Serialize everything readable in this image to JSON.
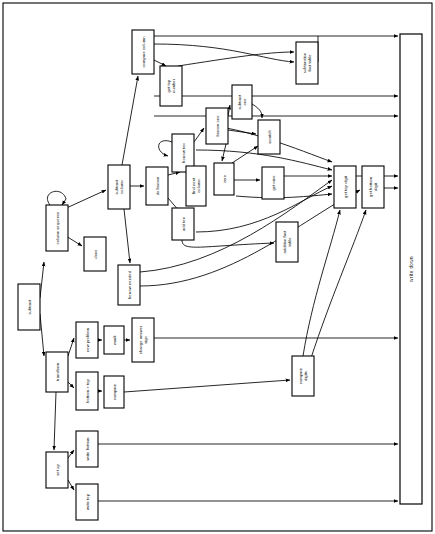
{
  "diagram": {
    "type": "flowchart",
    "orientation": "rotated-90-ccw-labels",
    "canvas": {
      "width": 435,
      "height": 534
    },
    "colors": {
      "stroke": "#000000",
      "fill": "#ffffff",
      "background": "#ffffff"
    },
    "border": {
      "x": 3,
      "y": 3,
      "width": 429,
      "height": 528
    },
    "nodes": [
      {
        "id": "subtract",
        "label": "subtract",
        "x": 18,
        "y": 284,
        "w": 22,
        "h": 46
      },
      {
        "id": "column-sequence",
        "label": "column sequence",
        "x": 46,
        "y": 205,
        "w": 22,
        "h": 46
      },
      {
        "id": "set-up",
        "label": "set up",
        "x": 46,
        "y": 452,
        "w": 22,
        "h": 36
      },
      {
        "id": "transform",
        "label": "transform",
        "x": 46,
        "y": 352,
        "w": 22,
        "h": 40
      },
      {
        "id": "done",
        "label": "done",
        "x": 84,
        "y": 237,
        "w": 22,
        "h": 34
      },
      {
        "id": "write-bottom",
        "label": "write bottom",
        "x": 76,
        "y": 431,
        "w": 22,
        "h": 36
      },
      {
        "id": "write-top",
        "label": "write top",
        "x": 76,
        "y": 484,
        "w": 22,
        "h": 36
      },
      {
        "id": "new-problem",
        "label": "new problem",
        "x": 76,
        "y": 322,
        "w": 22,
        "h": 36
      },
      {
        "id": "mark",
        "label": "mark",
        "x": 104,
        "y": 326,
        "w": 20,
        "h": 28
      },
      {
        "id": "change-answer-sign",
        "label": "change answer sign",
        "x": 132,
        "y": 318,
        "w": 22,
        "h": 44
      },
      {
        "id": "bottom-gt-top",
        "label": "bottom > top",
        "x": 76,
        "y": 372,
        "w": 22,
        "h": 38
      },
      {
        "id": "compare",
        "label": "compare",
        "x": 104,
        "y": 376,
        "w": 20,
        "h": 32
      },
      {
        "id": "subtract-column",
        "label": "subtract column",
        "x": 108,
        "y": 165,
        "w": 22,
        "h": 44
      },
      {
        "id": "borrow-needed",
        "label": "borrow needed",
        "x": 118,
        "y": 265,
        "w": 22,
        "h": 40
      },
      {
        "id": "do-borrow",
        "label": "do borrow",
        "x": 146,
        "y": 167,
        "w": 22,
        "h": 38
      },
      {
        "id": "compare-column",
        "label": "compare column",
        "x": 132,
        "y": 30,
        "w": 22,
        "h": 44
      },
      {
        "id": "get-top-number",
        "label": "get top number",
        "x": 160,
        "y": 66,
        "w": 22,
        "h": 40
      },
      {
        "id": "borrow-ten",
        "label": "borrow ten",
        "x": 172,
        "y": 134,
        "w": 22,
        "h": 38
      },
      {
        "id": "add-ten",
        "label": "add ten",
        "x": 172,
        "y": 208,
        "w": 22,
        "h": 32
      },
      {
        "id": "find-next-column",
        "label": "find next column",
        "x": 186,
        "y": 166,
        "w": 20,
        "h": 40
      },
      {
        "id": "borrow-one",
        "label": "borrow one",
        "x": 206,
        "y": 108,
        "w": 22,
        "h": 36
      },
      {
        "id": "subtract-one",
        "label": "subtract one",
        "x": 232,
        "y": 85,
        "w": 20,
        "h": 34
      },
      {
        "id": "zero",
        "label": "zero",
        "x": 214,
        "y": 163,
        "w": 20,
        "h": 32
      },
      {
        "id": "scratch",
        "label": "scratch",
        "x": 258,
        "y": 120,
        "w": 22,
        "h": 34
      },
      {
        "id": "get-nine",
        "label": "get nine",
        "x": 262,
        "y": 167,
        "w": 22,
        "h": 32
      },
      {
        "id": "addition-fact-table",
        "label": "addition fact table",
        "x": 276,
        "y": 222,
        "w": 22,
        "h": 40
      },
      {
        "id": "subtraction-fact-table",
        "label": "subtraction fact table",
        "x": 296,
        "y": 42,
        "w": 22,
        "h": 42
      },
      {
        "id": "get-top-digit",
        "label": "get top digit",
        "x": 334,
        "y": 166,
        "w": 22,
        "h": 42
      },
      {
        "id": "get-bottom-digit",
        "label": "get bottom digit",
        "x": 362,
        "y": 166,
        "w": 22,
        "h": 42
      },
      {
        "id": "compare-digits",
        "label": "compare digits",
        "x": 292,
        "y": 356,
        "w": 22,
        "h": 40
      },
      {
        "id": "write-down",
        "label": "write down",
        "x": 400,
        "y": 34,
        "w": 22,
        "h": 470,
        "tall": true
      }
    ],
    "edges": [
      {
        "from": "subtract",
        "to": "column-sequence"
      },
      {
        "from": "subtract",
        "to": "transform"
      },
      {
        "from": "column-sequence",
        "to": "column-sequence",
        "type": "self-loop"
      },
      {
        "from": "column-sequence",
        "to": "subtract-column"
      },
      {
        "from": "column-sequence",
        "to": "done"
      },
      {
        "from": "transform",
        "to": "new-problem"
      },
      {
        "from": "transform",
        "to": "bottom-gt-top"
      },
      {
        "from": "transform",
        "to": "set-up"
      },
      {
        "from": "new-problem",
        "to": "mark"
      },
      {
        "from": "mark",
        "to": "change-answer-sign"
      },
      {
        "from": "change-answer-sign",
        "to": "write-down"
      },
      {
        "from": "bottom-gt-top",
        "to": "compare"
      },
      {
        "from": "compare",
        "to": "compare-digits"
      },
      {
        "from": "compare-digits",
        "to": "get-top-digit"
      },
      {
        "from": "compare-digits",
        "to": "get-bottom-digit"
      },
      {
        "from": "set-up",
        "to": "write-bottom"
      },
      {
        "from": "set-up",
        "to": "write-top"
      },
      {
        "from": "write-bottom",
        "to": "write-down"
      },
      {
        "from": "write-top",
        "to": "write-down"
      },
      {
        "from": "subtract-column",
        "to": "do-borrow"
      },
      {
        "from": "subtract-column",
        "to": "compare-column"
      },
      {
        "from": "subtract-column",
        "to": "borrow-needed"
      },
      {
        "from": "do-borrow",
        "to": "borrow-ten"
      },
      {
        "from": "do-borrow",
        "to": "add-ten"
      },
      {
        "from": "borrow-ten",
        "to": "borrow-one"
      },
      {
        "from": "borrow-ten",
        "to": "find-next-column"
      },
      {
        "from": "borrow-ten",
        "to": "borrow-ten",
        "type": "self-loop"
      },
      {
        "from": "borrow-one",
        "to": "subtract-one"
      },
      {
        "from": "borrow-one",
        "to": "zero"
      },
      {
        "from": "borrow-one",
        "to": "scratch"
      },
      {
        "from": "zero",
        "to": "get-nine"
      },
      {
        "from": "zero",
        "to": "scratch"
      },
      {
        "from": "subtract-one",
        "to": "scratch"
      },
      {
        "from": "add-ten",
        "to": "addition-fact-table"
      },
      {
        "from": "compare-column",
        "to": "get-top-number"
      },
      {
        "from": "compare-column",
        "to": "subtraction-fact-table"
      },
      {
        "from": "compare-column",
        "to": "write-down"
      },
      {
        "from": "get-top-number",
        "to": "subtraction-fact-table"
      },
      {
        "from": "get-top-digit",
        "to": "write-down"
      },
      {
        "from": "get-bottom-digit",
        "to": "write-down"
      },
      {
        "from": "borrow-needed",
        "to": "get-top-digit"
      },
      {
        "from": "borrow-needed",
        "to": "get-bottom-digit"
      }
    ]
  }
}
